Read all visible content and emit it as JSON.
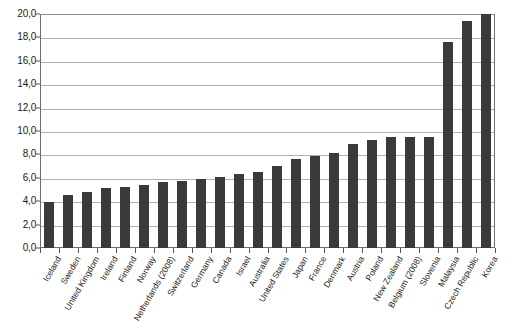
{
  "chart_data": {
    "type": "bar",
    "title": "",
    "subtitle": "",
    "xlabel": "",
    "ylabel": "",
    "ylim": [
      0,
      20
    ],
    "ytick_step": 2,
    "grid": true,
    "legend": null,
    "decimal_separator": ",",
    "bar_color": "#3a3a3a",
    "grid_color": "#b0b0b0",
    "axis_color": "#6e6e6e",
    "ytick_labels": [
      "0,0",
      "2,0",
      "4,0",
      "6,0",
      "8,0",
      "10,0",
      "12,0",
      "14,0",
      "16,0",
      "18,0",
      "20,0"
    ],
    "ytick_values": [
      0,
      2,
      4,
      6,
      8,
      10,
      12,
      14,
      16,
      18,
      20
    ],
    "categories": [
      "Iceland",
      "Sweden",
      "United Kingdom",
      "Ireland",
      "Finland",
      "Norway",
      "Netherlands (2008)",
      "Switzerland",
      "Germany",
      "Canada",
      "Israel",
      "Australia",
      "United States",
      "Japan",
      "France",
      "Denmark",
      "Austria",
      "Poland",
      "New Zealand",
      "Belgium (2008)",
      "Slovenia",
      "Malaysia",
      "Czech Republic",
      "Korea"
    ],
    "values": [
      3.9,
      4.5,
      4.8,
      5.1,
      5.2,
      5.4,
      5.6,
      5.7,
      5.9,
      6.1,
      6.3,
      6.5,
      7.0,
      7.6,
      7.9,
      8.1,
      8.9,
      9.2,
      9.5,
      9.5,
      9.5,
      17.6,
      19.4,
      20.0
    ]
  }
}
